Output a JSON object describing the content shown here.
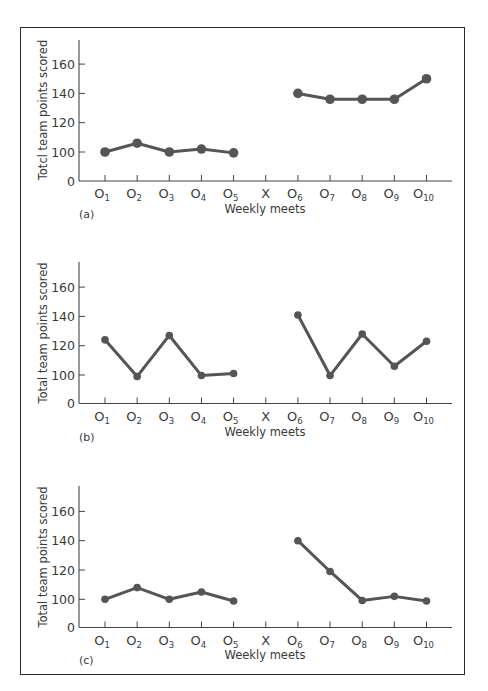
{
  "figure": {
    "x_title": "Weekly meets",
    "x_ticks": [
      {
        "main": "O",
        "sub": "1"
      },
      {
        "main": "O",
        "sub": "2"
      },
      {
        "main": "O",
        "sub": "3"
      },
      {
        "main": "O",
        "sub": "4"
      },
      {
        "main": "O",
        "sub": "5"
      },
      {
        "main": "X",
        "sub": ""
      },
      {
        "main": "O",
        "sub": "6"
      },
      {
        "main": "O",
        "sub": "7"
      },
      {
        "main": "O",
        "sub": "8"
      },
      {
        "main": "O",
        "sub": "9"
      },
      {
        "main": "O",
        "sub": "10"
      }
    ],
    "y_ticks": [
      "0",
      "100",
      "120",
      "140",
      "160"
    ],
    "line_color": "#555555",
    "frame_color": "#2a2a2a"
  },
  "panels": [
    {
      "label": "(a)",
      "ylabel": "Totcl team points scored"
    },
    {
      "label": "(b)",
      "ylabel": "Total team points scored"
    },
    {
      "label": "(c)",
      "ylabel": "Total team points scored"
    }
  ],
  "chart_data": [
    {
      "type": "line",
      "title": "(a)",
      "xlabel": "Weekly meets",
      "ylabel": "Totcl team points scored",
      "categories": [
        "O1",
        "O2",
        "O3",
        "O4",
        "O5",
        "X",
        "O6",
        "O7",
        "O8",
        "O9",
        "O10"
      ],
      "y_ticks": [
        0,
        100,
        120,
        140,
        160
      ],
      "ylim": [
        0,
        170
      ],
      "axis_break": "between 0 and 100",
      "grid": false,
      "legend": null,
      "series": [
        {
          "name": "baseline",
          "x": [
            "O1",
            "O2",
            "O3",
            "O4",
            "O5"
          ],
          "values": [
            100,
            106,
            100,
            102,
            97
          ]
        },
        {
          "name": "treatment",
          "x": [
            "O6",
            "O7",
            "O8",
            "O9",
            "O10"
          ],
          "values": [
            140,
            136,
            136,
            136,
            150
          ]
        }
      ]
    },
    {
      "type": "line",
      "title": "(b)",
      "xlabel": "Weekly meets",
      "ylabel": "Total team points scored",
      "categories": [
        "O1",
        "O2",
        "O3",
        "O4",
        "O5",
        "X",
        "O6",
        "O7",
        "O8",
        "O9",
        "O10"
      ],
      "y_ticks": [
        0,
        100,
        120,
        140,
        160
      ],
      "ylim": [
        0,
        170
      ],
      "axis_break": "between 0 and 100",
      "grid": false,
      "legend": null,
      "series": [
        {
          "name": "baseline",
          "x": [
            "O1",
            "O2",
            "O3",
            "O4",
            "O5"
          ],
          "values": [
            124,
            95,
            127,
            98,
            101
          ]
        },
        {
          "name": "treatment",
          "x": [
            "O6",
            "O7",
            "O8",
            "O9",
            "O10"
          ],
          "values": [
            141,
            98,
            128,
            106,
            123
          ]
        }
      ]
    },
    {
      "type": "line",
      "title": "(c)",
      "xlabel": "Weekly meets",
      "ylabel": "Total team points scored",
      "categories": [
        "O1",
        "O2",
        "O3",
        "O4",
        "O5",
        "X",
        "O6",
        "O7",
        "O8",
        "O9",
        "O10"
      ],
      "y_ticks": [
        0,
        100,
        120,
        140,
        160
      ],
      "ylim": [
        0,
        170
      ],
      "axis_break": "between 0 and 100",
      "grid": false,
      "legend": null,
      "series": [
        {
          "name": "baseline",
          "x": [
            "O1",
            "O2",
            "O3",
            "O4",
            "O5"
          ],
          "values": [
            100,
            108,
            100,
            105,
            94
          ]
        },
        {
          "name": "treatment",
          "x": [
            "O6",
            "O7",
            "O8",
            "O9",
            "O10"
          ],
          "values": [
            140,
            119,
            96,
            102,
            94
          ]
        }
      ]
    }
  ]
}
